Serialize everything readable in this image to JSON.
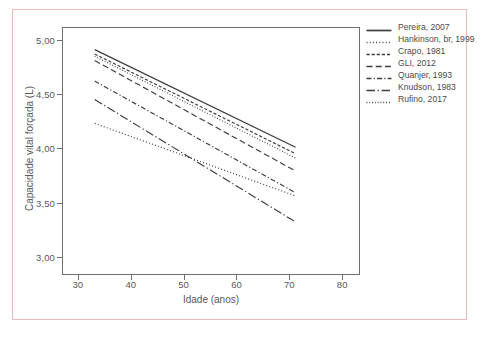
{
  "figure": {
    "background_color": "#ffffff",
    "frame_color": "#e8bcbc",
    "axis_color": "#6f6f6f",
    "text_color": "#58585a"
  },
  "chart_data": {
    "type": "line",
    "title": "",
    "xlabel": "Idade (anos)",
    "ylabel": "Capacidade vital forçada (L)",
    "xlim": [
      27,
      83
    ],
    "ylim": [
      2.85,
      5.12
    ],
    "xticks": [
      30,
      40,
      50,
      60,
      70,
      80
    ],
    "xticklabels": [
      "30",
      "40",
      "50",
      "60",
      "70",
      "80"
    ],
    "yticks": [
      3.0,
      3.5,
      4.0,
      4.5,
      5.0
    ],
    "yticklabels": [
      "3,00",
      "3,50",
      "4,00",
      "4,50",
      "5,00"
    ],
    "grid": false,
    "legend_position": "right-outside",
    "x": [
      33,
      71
    ],
    "series": [
      {
        "name": "Pereira, 2007",
        "dash": "solid",
        "color": "#3c3c3c",
        "values": [
          4.92,
          4.02
        ]
      },
      {
        "name": "Hankinson, br, 1999",
        "dash": "dotted",
        "color": "#3c3c3c",
        "values": [
          4.24,
          3.57
        ]
      },
      {
        "name": "Crapo, 1981",
        "dash": "dashed-short",
        "color": "#3c3c3c",
        "values": [
          4.88,
          3.96
        ]
      },
      {
        "name": "GLI, 2012",
        "dash": "dashed-long",
        "color": "#3c3c3c",
        "values": [
          4.82,
          3.8
        ]
      },
      {
        "name": "Quanjer, 1993",
        "dash": "dash-dot",
        "color": "#3c3c3c",
        "values": [
          4.63,
          3.6
        ]
      },
      {
        "name": "Knudson, 1983",
        "dash": "long-dash-dot",
        "color": "#3c3c3c",
        "values": [
          4.46,
          3.33
        ]
      },
      {
        "name": "Rufino, 2017",
        "dash": "fine-dotted",
        "color": "#3c3c3c",
        "values": [
          4.86,
          3.92
        ]
      }
    ]
  },
  "legend": {
    "entries": [
      {
        "label": "Pereira, 2007"
      },
      {
        "label": "Hankinson, br, 1999"
      },
      {
        "label": "Crapo, 1981"
      },
      {
        "label": "GLI, 2012"
      },
      {
        "label": "Quanjer, 1993"
      },
      {
        "label": "Knudson, 1983"
      },
      {
        "label": "Rufino, 2017"
      }
    ]
  }
}
